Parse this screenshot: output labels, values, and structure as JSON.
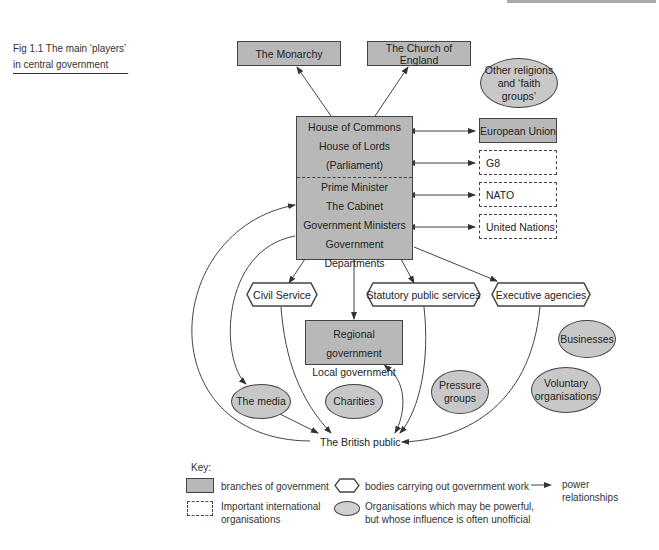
{
  "figure": {
    "caption": "Fig 1.1  The main ‘players’ in central government"
  },
  "nodes": {
    "monarchy": "The Monarchy",
    "church": "The Church of England",
    "other_religions": [
      "Other religions",
      "and ‘faith groups’"
    ],
    "parliament": [
      "House of Commons",
      "House of Lords",
      "(Parliament)"
    ],
    "executive": [
      "Prime Minister",
      "The Cabinet",
      "Government Ministers",
      "Government Departments"
    ],
    "european_union": "European Union",
    "g8": "G8",
    "nato": "NATO",
    "united_nations": "United Nations",
    "civil_service": "Civil Service",
    "statutory": "Statutory public services",
    "exec_agencies": "Executive agencies",
    "regional_local": [
      "Regional government",
      "Local government"
    ],
    "businesses": "Businesses",
    "media": "The media",
    "charities": "Charities",
    "pressure_groups": [
      "Pressure",
      "groups"
    ],
    "voluntary": [
      "Voluntary",
      "organisations"
    ],
    "public": "The British public"
  },
  "key": {
    "title": "Key:",
    "branches": "branches of government",
    "international": [
      "Important international",
      "organisations"
    ],
    "bodies": "bodies carrying out government work",
    "organisations": [
      "Organisations which may be powerful,",
      "but whose influence is often unofficial"
    ],
    "power": [
      "power",
      "relationships"
    ]
  },
  "colors": {
    "government_fill": "#b8b8b8",
    "ellipse_fill": "#c8c8c8",
    "stroke": "#444444"
  }
}
